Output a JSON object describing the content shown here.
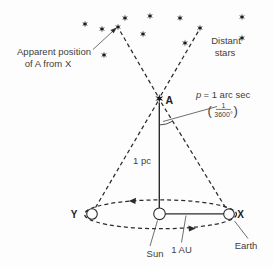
{
  "diagram": {
    "colors": {
      "ink": "#2b2b2b",
      "text": "#3d3d3d",
      "background": "#fdfdfd"
    },
    "labels": {
      "apparent_position_line1": "Apparent position",
      "apparent_position_line2": "of A from X",
      "distant_stars_line1": "Distant",
      "distant_stars_line2": "stars",
      "star_a": "A",
      "parallax_var": "p",
      "parallax_value": "= 1 arc sec",
      "fraction_open_paren": "(",
      "fraction_numerator": "1",
      "fraction_denominator": "3600°",
      "fraction_close_paren": ")",
      "distance": "1 pc",
      "point_y": "Y",
      "point_x": "X",
      "sun": "Sun",
      "astronomical_unit": "1 AU",
      "earth": "Earth"
    },
    "stars": [
      [
        85,
        24
      ],
      [
        102,
        29
      ],
      [
        118,
        27
      ],
      [
        125,
        18
      ],
      [
        143,
        34
      ],
      [
        150,
        16
      ],
      [
        104,
        55
      ],
      [
        180,
        18
      ],
      [
        200,
        28
      ],
      [
        242,
        17
      ],
      [
        185,
        43
      ],
      [
        242,
        38
      ]
    ],
    "star_a_position": [
      159.3,
      98.5
    ]
  }
}
